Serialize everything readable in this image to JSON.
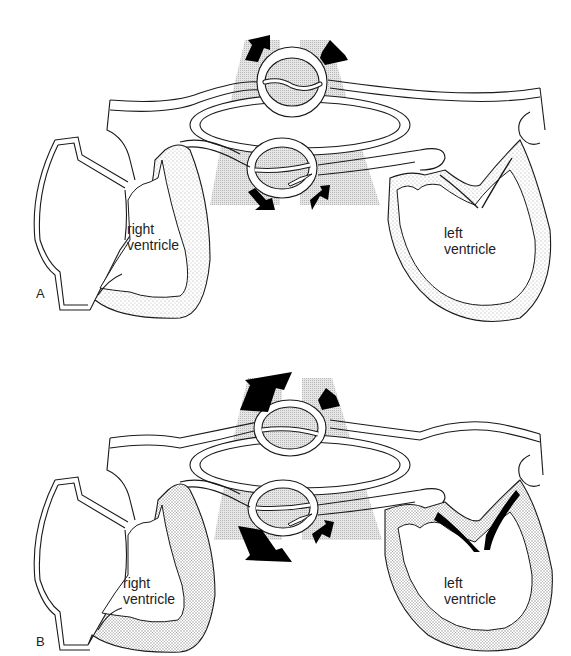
{
  "figure": {
    "panels": [
      {
        "id": "A",
        "letter": "A",
        "labels": {
          "right_ventricle": [
            "right",
            "ventricle"
          ],
          "left_ventricle": [
            "left",
            "ventricle"
          ]
        },
        "arrows": {
          "upper_left": "small",
          "upper_right": "small",
          "lower_left": "small",
          "lower_right": "small"
        },
        "mitral_leaflets": "open-thin",
        "ventricle_wall": "thin"
      },
      {
        "id": "B",
        "letter": "B",
        "labels": {
          "right_ventricle": [
            "right",
            "ventricle"
          ],
          "left_ventricle": [
            "left",
            "ventricle"
          ]
        },
        "arrows": {
          "upper_left": "large",
          "upper_right": "small",
          "lower_left": "large",
          "lower_right": "small"
        },
        "mitral_leaflets": "thickened-black",
        "ventricle_wall": "thick-stippled"
      }
    ],
    "colors": {
      "line": "#1a1a1a",
      "arrow_fill": "#000000",
      "lung_shading": "#bdbdbd",
      "stipple": "#c8c8c8",
      "background": "#ffffff"
    }
  }
}
